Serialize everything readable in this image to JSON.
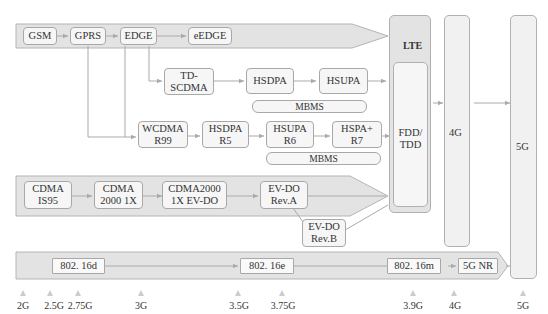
{
  "gsm_band": {
    "gsm": "GSM",
    "gprs": "GPRS",
    "edge": "EDGE",
    "eedge": "eEDGE"
  },
  "td_branch": {
    "tdscdma_1": "TD-",
    "tdscdma_2": "SCDMA",
    "hsdpa": "HSDPA",
    "hsupa": "HSUPA",
    "mbms": "MBMS"
  },
  "wcdma_branch": {
    "wcdma_1": "WCDMA",
    "wcdma_2": "R99",
    "hsdpa_1": "HSDPA",
    "hsdpa_2": "R5",
    "hsupa_1": "HSUPA",
    "hsupa_2": "R6",
    "hspa_1": "HSPA+",
    "hspa_2": "R7",
    "mbms": "MBMS"
  },
  "cdma_band": {
    "is95_1": "CDMA",
    "is95_2": "IS95",
    "c2000_1": "CDMA",
    "c2000_2": "2000 1X",
    "evdo_1": "CDMA2000",
    "evdo_2": "1X EV-DO",
    "reva_1": "EV-DO",
    "reva_2": "Rev.A",
    "revb_1": "EV-DO",
    "revb_2": "Rev.B"
  },
  "lte": {
    "title": "LTE",
    "fdd_1": "FDD/",
    "fdd_2": "TDD"
  },
  "columns": {
    "g4": "4G",
    "g5": "5G"
  },
  "wimax_band": {
    "d": "802. 16d",
    "e": "802. 16e",
    "m": "802. 16m",
    "nr": "5G NR"
  },
  "generations": [
    "2G",
    "2.5G",
    "2.75G",
    "3G",
    "3.5G",
    "3.75G",
    "3.9G",
    "4G",
    "5G"
  ]
}
